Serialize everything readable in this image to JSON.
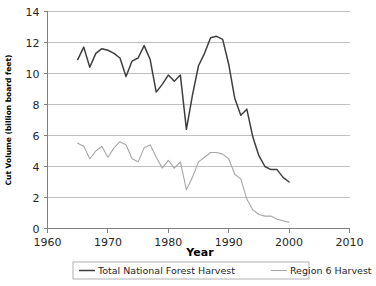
{
  "chart_data": {
    "type": "line",
    "title": "",
    "xlabel": "Year",
    "ylabel": "Cut Volume (billion board feet)",
    "xlim": [
      1960,
      2010
    ],
    "ylim": [
      0,
      14
    ],
    "x_ticks": [
      1960,
      1970,
      1980,
      1990,
      2000,
      2010
    ],
    "y_ticks": [
      0,
      2,
      4,
      6,
      8,
      10,
      12,
      14
    ],
    "grid": "horizontal",
    "legend_position": "bottom",
    "colors": {
      "total_national_forest_harvest": "#3f3f3f",
      "region_6_harvest": "#a6a6a6",
      "gridline": "#bfbfbf",
      "axis": "#808080",
      "background": "#ffffff"
    },
    "series": [
      {
        "name": "Total National Forest Harvest",
        "color": "#3f3f3f",
        "x": [
          1965,
          1966,
          1967,
          1968,
          1969,
          1970,
          1971,
          1972,
          1973,
          1974,
          1975,
          1976,
          1977,
          1978,
          1979,
          1980,
          1981,
          1982,
          1983,
          1984,
          1985,
          1986,
          1987,
          1988,
          1989,
          1990,
          1991,
          1992,
          1993,
          1994,
          1995,
          1996,
          1997,
          1998,
          1999,
          2000
        ],
        "values": [
          10.9,
          11.7,
          10.4,
          11.3,
          11.6,
          11.5,
          11.3,
          11.0,
          9.8,
          10.8,
          11.0,
          11.8,
          10.9,
          8.8,
          9.3,
          9.9,
          9.5,
          9.9,
          6.4,
          8.6,
          10.5,
          11.3,
          12.3,
          12.4,
          12.2,
          10.6,
          8.4,
          7.3,
          7.7,
          5.9,
          4.7,
          4.0,
          3.8,
          3.8,
          3.3,
          3.0
        ]
      },
      {
        "name": "Region 6 Harvest",
        "color": "#a6a6a6",
        "x": [
          1965,
          1966,
          1967,
          1968,
          1969,
          1970,
          1971,
          1972,
          1973,
          1974,
          1975,
          1976,
          1977,
          1978,
          1979,
          1980,
          1981,
          1982,
          1983,
          1984,
          1985,
          1986,
          1987,
          1988,
          1989,
          1990,
          1991,
          1992,
          1993,
          1994,
          1995,
          1996,
          1997,
          1998,
          1999,
          2000
        ],
        "values": [
          5.5,
          5.3,
          4.5,
          5.0,
          5.3,
          4.6,
          5.2,
          5.6,
          5.4,
          4.5,
          4.3,
          5.2,
          5.4,
          4.6,
          3.9,
          4.4,
          3.9,
          4.3,
          2.5,
          3.3,
          4.3,
          4.6,
          4.9,
          4.9,
          4.8,
          4.5,
          3.5,
          3.2,
          1.9,
          1.2,
          0.9,
          0.8,
          0.8,
          0.6,
          0.5,
          0.4
        ]
      }
    ]
  },
  "legend": {
    "items": [
      {
        "label": "Total National Forest Harvest"
      },
      {
        "label": "Region 6 Harvest"
      }
    ]
  },
  "axes": {
    "x_title": "Year",
    "y_title": "Cut Volume (billion board feet)",
    "x_tick_labels": [
      "1960",
      "1970",
      "1980",
      "1990",
      "2000",
      "2010"
    ],
    "y_tick_labels": [
      "0",
      "2",
      "4",
      "6",
      "8",
      "10",
      "12",
      "14"
    ]
  }
}
